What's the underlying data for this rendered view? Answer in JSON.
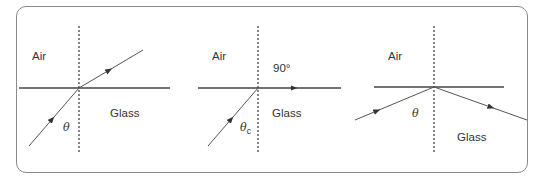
{
  "diagram": {
    "title": "",
    "colors": {
      "line": "#444444",
      "ray": "#555555",
      "frame": "#8a8a8a",
      "text": "#333333"
    },
    "panels": [
      {
        "id": "refraction",
        "labels": {
          "top_medium": "Air",
          "bottom_medium": "Glass",
          "angle": "θ",
          "angle_sub": ""
        }
      },
      {
        "id": "critical-angle",
        "labels": {
          "top_medium": "Air",
          "bottom_medium": "Glass",
          "angle": "θ",
          "angle_sub": "c",
          "refraction_angle": "90°"
        }
      },
      {
        "id": "total-internal-reflection",
        "labels": {
          "top_medium": "Air",
          "bottom_medium": "Glass",
          "angle": "θ",
          "angle_sub": ""
        }
      }
    ]
  }
}
